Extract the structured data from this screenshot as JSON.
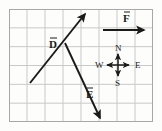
{
  "figure": {
    "name": "vector-grid-diagram",
    "width": 162,
    "height": 131,
    "background_color": "#fdfdfc",
    "border_color": "#b8b8b8"
  },
  "grid": {
    "columns": 8,
    "rows": 6,
    "cell_width": 18,
    "cell_height": 18.83,
    "left": 9,
    "top": 9,
    "right": 153,
    "bottom": 122,
    "line_color": "#c9c9c9",
    "border_color": "#a8a8a8"
  },
  "vectors": [
    {
      "id": "D",
      "label": "D",
      "label_text": "D⃗",
      "color": "#1a1a1a",
      "start": {
        "x": 30,
        "y": 83
      },
      "end": {
        "x": 85,
        "y": 14
      },
      "label_pos": {
        "x": 49,
        "y": 35
      },
      "direction": "up-right"
    },
    {
      "id": "E",
      "label": "E",
      "label_text": "E⃗",
      "color": "#1a1a1a",
      "start": {
        "x": 65,
        "y": 43
      },
      "end": {
        "x": 100,
        "y": 118
      },
      "label_pos": {
        "x": 86,
        "y": 85
      },
      "direction": "down-right"
    },
    {
      "id": "F",
      "label": "F",
      "label_text": "F⃗",
      "color": "#1a1a1a",
      "start": {
        "x": 103,
        "y": 30
      },
      "end": {
        "x": 144,
        "y": 30
      },
      "label_pos": {
        "x": 123,
        "y": 9
      },
      "direction": "right"
    }
  ],
  "compass": {
    "name": "compass-rose",
    "center": {
      "x": 118,
      "y": 65
    },
    "arm": 11,
    "color": "#1a1a1a",
    "labels": [
      {
        "id": "N",
        "text": "N",
        "x": 115,
        "y": 44
      },
      {
        "id": "S",
        "text": "S",
        "x": 115,
        "y": 79
      },
      {
        "id": "E",
        "text": "E",
        "x": 135,
        "y": 61
      },
      {
        "id": "W",
        "text": "W",
        "x": 95,
        "y": 61
      }
    ]
  }
}
